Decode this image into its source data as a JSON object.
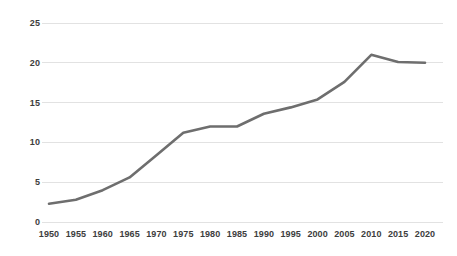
{
  "chart_data": {
    "type": "line",
    "title": "",
    "subtitle": "",
    "xlabel": "",
    "ylabel": "",
    "x": [
      1950,
      1955,
      1960,
      1965,
      1970,
      1975,
      1980,
      1985,
      1990,
      1995,
      2000,
      2005,
      2010,
      2015,
      2020
    ],
    "values": [
      2.3,
      2.8,
      4.0,
      5.6,
      8.4,
      11.2,
      12.0,
      12.0,
      13.6,
      14.4,
      15.4,
      17.6,
      21.0,
      20.1,
      20.0
    ],
    "series": [
      {
        "name": "series-1",
        "values": [
          2.3,
          2.8,
          4.0,
          5.6,
          8.4,
          11.2,
          12.0,
          12.0,
          13.6,
          14.4,
          15.4,
          17.6,
          21.0,
          20.1,
          20.0
        ]
      }
    ],
    "categories": [
      "1950",
      "1955",
      "1960",
      "1965",
      "1970",
      "1975",
      "1980",
      "1985",
      "1990",
      "1995",
      "2000",
      "2005",
      "2010",
      "2015",
      "2020"
    ],
    "xlim": [
      1950,
      2020
    ],
    "ylim": [
      0,
      25
    ],
    "yticks": [
      0,
      5,
      10,
      15,
      20,
      25
    ],
    "ytick_labels": [
      "0",
      "5",
      "10",
      "15",
      "20",
      "25"
    ],
    "xticks": [
      1950,
      1955,
      1960,
      1965,
      1970,
      1975,
      1980,
      1985,
      1990,
      1995,
      2000,
      2005,
      2010,
      2015,
      2020
    ],
    "xtick_labels": [
      "1950",
      "1955",
      "1960",
      "1965",
      "1970",
      "1975",
      "1980",
      "1985",
      "1990",
      "1995",
      "2000",
      "2005",
      "2010",
      "2015",
      "2020"
    ],
    "grid": "horizontal",
    "legend": "none",
    "annotations": [],
    "colors": {
      "line": "#6e6e6e",
      "grid": "#e2e2e2",
      "text": "#3d3d3d",
      "background": "#ffffff"
    },
    "line_width": 2.6
  },
  "axes": {
    "y_labels": [
      "25",
      "20",
      "15",
      "10",
      "5",
      "0"
    ],
    "x_labels": [
      "1950",
      "1955",
      "1960",
      "1965",
      "1970",
      "1975",
      "1980",
      "1985",
      "1990",
      "1995",
      "2000",
      "2005",
      "2010",
      "2015",
      "2020"
    ]
  }
}
